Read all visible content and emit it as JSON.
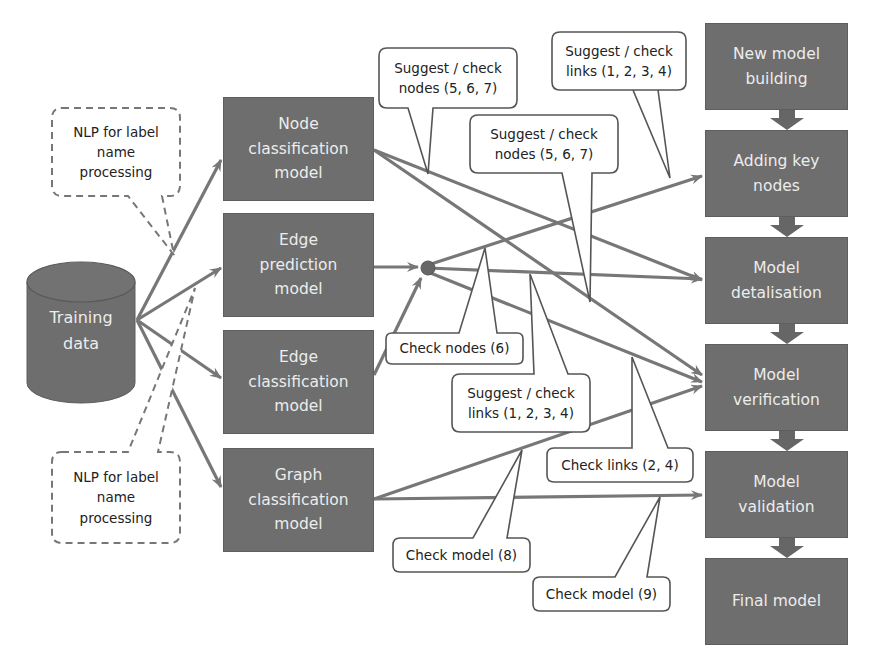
{
  "colors": {
    "box_fill": "#6e6e6e",
    "box_text": "#ececec",
    "arrow": "#777777",
    "callout_border": "#555555",
    "callout_text": "#222222",
    "background": "#ffffff"
  },
  "source": {
    "label": "Training\ndata",
    "shape": "cylinder"
  },
  "models": [
    {
      "id": "node_cls",
      "label": "Node\nclassification\nmodel"
    },
    {
      "id": "edge_pred",
      "label": "Edge\nprediction\nmodel"
    },
    {
      "id": "edge_cls",
      "label": "Edge\nclassification\nmodel"
    },
    {
      "id": "graph_cls",
      "label": "Graph\nclassification\nmodel"
    }
  ],
  "stages": [
    {
      "id": "new_model",
      "label": "New model\nbuilding"
    },
    {
      "id": "key_nodes",
      "label": "Adding key\nnodes"
    },
    {
      "id": "detalisation",
      "label": "Model\ndetalisation"
    },
    {
      "id": "verification",
      "label": "Model\nverification"
    },
    {
      "id": "validation",
      "label": "Model\nvalidation"
    },
    {
      "id": "final",
      "label": "Final model"
    }
  ],
  "nlp_callouts": [
    {
      "id": "nlp_top",
      "label": "NLP for label\nname\nprocessing",
      "style": "dashed"
    },
    {
      "id": "nlp_bottom",
      "label": "NLP for label\nname\nprocessing",
      "style": "dashed"
    }
  ],
  "callouts": [
    {
      "id": "c_nodes_567_a",
      "label": "Suggest / check\nnodes (5, 6, 7)"
    },
    {
      "id": "c_links_1234_a",
      "label": "Suggest / check\nlinks (1, 2, 3, 4)"
    },
    {
      "id": "c_nodes_567_b",
      "label": "Suggest / check\nnodes (5, 6, 7)"
    },
    {
      "id": "c_nodes_6",
      "label": "Check nodes (6)"
    },
    {
      "id": "c_links_1234_b",
      "label": "Suggest / check\nlinks (1, 2, 3, 4)"
    },
    {
      "id": "c_links_24",
      "label": "Check links (2, 4)"
    },
    {
      "id": "c_model_8",
      "label": "Check model (8)"
    },
    {
      "id": "c_model_9",
      "label": "Check model (9)"
    }
  ],
  "edges": [
    {
      "from": "source",
      "to": "node_cls"
    },
    {
      "from": "source",
      "to": "edge_pred"
    },
    {
      "from": "source",
      "to": "edge_cls"
    },
    {
      "from": "source",
      "to": "graph_cls"
    },
    {
      "from": "edge_pred",
      "to": "junction"
    },
    {
      "from": "edge_cls",
      "to": "junction"
    },
    {
      "from": "node_cls",
      "to": "detalisation"
    },
    {
      "from": "node_cls",
      "to": "verification"
    },
    {
      "from": "junction",
      "to": "key_nodes"
    },
    {
      "from": "junction",
      "to": "detalisation"
    },
    {
      "from": "junction",
      "to": "verification"
    },
    {
      "from": "graph_cls",
      "to": "verification"
    },
    {
      "from": "graph_cls",
      "to": "validation"
    },
    {
      "from": "new_model",
      "to": "key_nodes"
    },
    {
      "from": "key_nodes",
      "to": "detalisation"
    },
    {
      "from": "detalisation",
      "to": "verification"
    },
    {
      "from": "verification",
      "to": "validation"
    },
    {
      "from": "validation",
      "to": "final"
    }
  ]
}
